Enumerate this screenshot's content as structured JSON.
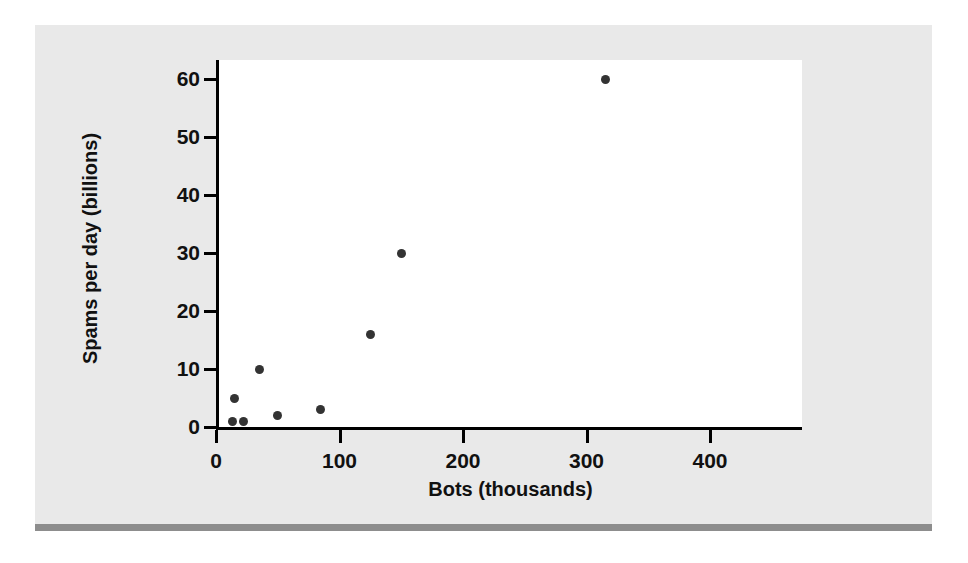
{
  "chart_data": {
    "type": "scatter",
    "title": "",
    "xlabel": "Bots (thousands)",
    "ylabel": "Spams per day (billions)",
    "xlim": [
      0,
      400
    ],
    "ylim": [
      0,
      63
    ],
    "grid": false,
    "legend": null,
    "xticks": [
      0,
      100,
      200,
      300,
      400
    ],
    "yticks": [
      0,
      10,
      20,
      30,
      40,
      50,
      60
    ],
    "xtick_labels": [
      "0",
      "100",
      "200",
      "300",
      "400"
    ],
    "ytick_labels": [
      "0",
      "10",
      "20",
      "30",
      "40",
      "50",
      "60"
    ],
    "series": [
      {
        "name": "Botnets",
        "marker": "circle",
        "color": "#333333",
        "points": [
          {
            "x": 13,
            "y": 1
          },
          {
            "x": 22,
            "y": 1
          },
          {
            "x": 15,
            "y": 5
          },
          {
            "x": 35,
            "y": 10
          },
          {
            "x": 50,
            "y": 2
          },
          {
            "x": 85,
            "y": 3
          },
          {
            "x": 125,
            "y": 16
          },
          {
            "x": 150,
            "y": 30
          },
          {
            "x": 315,
            "y": 60
          }
        ]
      }
    ]
  },
  "figure": {
    "panel_color": "#e9e9e9",
    "plot_background": "#ffffff",
    "axis_color": "#000000",
    "rule_color": "#8d8d8d"
  }
}
